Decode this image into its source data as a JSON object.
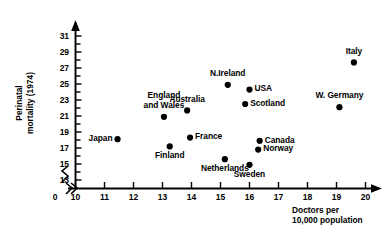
{
  "chart_data": {
    "type": "scatter",
    "title": "",
    "xlabel": "Doctors per 10,000 population",
    "xlabel_lines": [
      "Doctors per",
      "10,000 population"
    ],
    "ylabel": "Perinatal mortality (1974)",
    "ylabel_lines": [
      "Perinatal",
      "mortality (1974)"
    ],
    "xlim": [
      10,
      20
    ],
    "ylim": [
      12,
      32
    ],
    "x_axis_break": true,
    "x_origin_label": "0",
    "grid": false,
    "legend": "none",
    "xticks": [
      "10",
      "11",
      "12",
      "13",
      "14",
      "15",
      "16",
      "17",
      "18",
      "19",
      "20"
    ],
    "yticks": [
      "31",
      "29",
      "27",
      "25",
      "23",
      "21",
      "19",
      "17",
      "15",
      "13"
    ],
    "points": [
      {
        "name": "Japan",
        "x": 11.45,
        "y": 18.1,
        "label": "Japan",
        "label_lines": [
          "Japan"
        ],
        "label_pos": "left"
      },
      {
        "name": "England and Wales",
        "x": 13.05,
        "y": 20.9,
        "label": "England and Wales",
        "label_lines": [
          "England",
          "and Wales"
        ],
        "label_pos": "above"
      },
      {
        "name": "Finland",
        "x": 13.25,
        "y": 17.2,
        "label": "Finland",
        "label_lines": [
          "Finland"
        ],
        "label_pos": "below"
      },
      {
        "name": "Australia",
        "x": 13.85,
        "y": 21.7,
        "label": "Australia",
        "label_lines": [
          "Australia"
        ],
        "label_pos": "above"
      },
      {
        "name": "France",
        "x": 13.95,
        "y": 18.3,
        "label": "France",
        "label_lines": [
          "France"
        ],
        "label_pos": "right"
      },
      {
        "name": "Netherlands",
        "x": 15.15,
        "y": 15.6,
        "label": "Netherlands",
        "label_lines": [
          "Netherlands"
        ],
        "label_pos": "below"
      },
      {
        "name": "N.Ireland",
        "x": 15.25,
        "y": 24.9,
        "label": "N.Ireland",
        "label_lines": [
          "N.Ireland"
        ],
        "label_pos": "above"
      },
      {
        "name": "Sweden",
        "x": 16.0,
        "y": 14.9,
        "label": "Sweden",
        "label_lines": [
          "Sweden"
        ],
        "label_pos": "below"
      },
      {
        "name": "Scotland",
        "x": 15.85,
        "y": 22.5,
        "label": "Scotland",
        "label_lines": [
          "Scotland"
        ],
        "label_pos": "right"
      },
      {
        "name": "USA",
        "x": 16.0,
        "y": 24.3,
        "label": "USA",
        "label_lines": [
          "USA"
        ],
        "label_pos": "right"
      },
      {
        "name": "Norway",
        "x": 16.3,
        "y": 16.8,
        "label": "Norway",
        "label_lines": [
          "Norway"
        ],
        "label_pos": "right"
      },
      {
        "name": "Canada",
        "x": 16.35,
        "y": 17.9,
        "label": "Canada",
        "label_lines": [
          "Canada"
        ],
        "label_pos": "right"
      },
      {
        "name": "W. Germany",
        "x": 19.1,
        "y": 22.1,
        "label": "W. Germany",
        "label_lines": [
          "W. Germany"
        ],
        "label_pos": "above"
      },
      {
        "name": "Italy",
        "x": 19.6,
        "y": 27.7,
        "label": "Italy",
        "label_lines": [
          "Italy"
        ],
        "label_pos": "above"
      }
    ]
  }
}
